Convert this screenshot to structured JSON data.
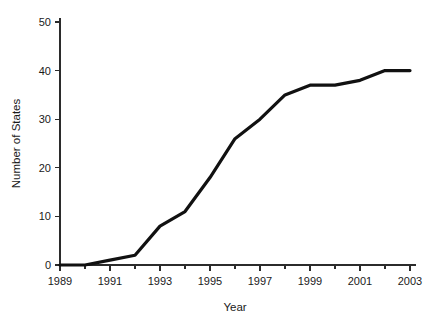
{
  "chart_data": {
    "type": "line",
    "title": "",
    "xlabel": "Year",
    "ylabel": "Number of States",
    "xlim": [
      1989,
      2003
    ],
    "ylim": [
      0,
      50
    ],
    "grid": false,
    "legend": false,
    "series_color": "#111111",
    "x": [
      1989,
      1990,
      1991,
      1992,
      1993,
      1994,
      1995,
      1996,
      1997,
      1998,
      1999,
      2000,
      2001,
      2002,
      2003
    ],
    "values": [
      0,
      0,
      1,
      2,
      8,
      11,
      18,
      26,
      30,
      35,
      37,
      37,
      38,
      40,
      40
    ],
    "series": [
      {
        "name": "Number of States",
        "values": [
          0,
          0,
          1,
          2,
          8,
          11,
          18,
          26,
          30,
          35,
          37,
          37,
          38,
          40,
          40
        ]
      }
    ],
    "x_major_ticks": [
      1989,
      1991,
      1993,
      1995,
      1997,
      1999,
      2001,
      2003
    ],
    "x_major_tick_labels": [
      "1989",
      "1991",
      "1993",
      "1995",
      "1997",
      "1999",
      "2001",
      "2003"
    ],
    "x_minor_ticks": [
      1990,
      1992,
      1994,
      1996,
      1998,
      2000,
      2002
    ],
    "y_ticks": [
      0,
      10,
      20,
      30,
      40,
      50
    ],
    "y_tick_labels": [
      "0",
      "10",
      "20",
      "30",
      "40",
      "50"
    ]
  }
}
